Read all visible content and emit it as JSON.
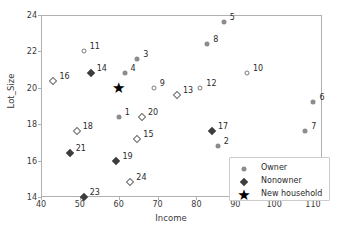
{
  "chart_data": {
    "type": "scatter",
    "title": "",
    "xlabel": "Income",
    "ylabel": "Lot_Size",
    "xlim": [
      40,
      115
    ],
    "ylim": [
      13.4,
      24.3
    ],
    "xticks": [
      40,
      50,
      60,
      70,
      80,
      90,
      100,
      110
    ],
    "yticks": [
      14,
      16,
      18,
      20,
      22,
      24
    ],
    "grid": false,
    "legend_position": "lower right",
    "legend": [
      {
        "label": "Owner",
        "marker": "circle-filled",
        "color": "#8c8c8c"
      },
      {
        "label": "Nonowner",
        "marker": "diamond-filled",
        "color": "#3d3d3d"
      },
      {
        "label": "New household",
        "marker": "star",
        "color": "#000000"
      }
    ],
    "series": [
      {
        "name": "Owner",
        "marker": "circle-filled",
        "color": "#8c8c8c",
        "points": [
          {
            "label": "1",
            "x": 60.0,
            "y": 18.4,
            "label_dx": 6,
            "label_dy": -4
          },
          {
            "label": "2",
            "x": 85.5,
            "y": 16.8,
            "label_dx": 6,
            "label_dy": -4
          },
          {
            "label": "3",
            "x": 64.8,
            "y": 21.6,
            "label_dx": 6,
            "label_dy": -4
          },
          {
            "label": "4",
            "x": 61.5,
            "y": 20.8,
            "label_dx": 6,
            "label_dy": -4
          },
          {
            "label": "5",
            "x": 87.0,
            "y": 23.6,
            "label_dx": 6,
            "label_dy": -4
          },
          {
            "label": "6",
            "x": 110.1,
            "y": 19.2,
            "label_dx": 6,
            "label_dy": -4
          },
          {
            "label": "7",
            "x": 108.0,
            "y": 17.6,
            "label_dx": 6,
            "label_dy": -4
          },
          {
            "label": "8",
            "x": 82.8,
            "y": 22.4,
            "label_dx": 6,
            "label_dy": -4
          }
        ]
      },
      {
        "name": "Owner-open",
        "marker": "circle-open",
        "color": "#7a7a7a",
        "points": [
          {
            "label": "9",
            "x": 69.0,
            "y": 20.0,
            "label_dx": 6,
            "label_dy": -4
          },
          {
            "label": "10",
            "x": 93.0,
            "y": 20.8,
            "label_dx": 6,
            "label_dy": -4
          },
          {
            "label": "11",
            "x": 51.0,
            "y": 22.0,
            "label_dx": 6,
            "label_dy": -4
          },
          {
            "label": "12",
            "x": 81.0,
            "y": 20.0,
            "label_dx": 6,
            "label_dy": -4
          }
        ]
      },
      {
        "name": "Nonowner",
        "marker": "diamond-filled",
        "color": "#3d3d3d",
        "points": [
          {
            "label": "14",
            "x": 52.8,
            "y": 20.8,
            "label_dx": 6,
            "label_dy": -4
          },
          {
            "label": "17",
            "x": 84.0,
            "y": 17.6,
            "label_dx": 6,
            "label_dy": -4
          },
          {
            "label": "19",
            "x": 59.4,
            "y": 16.0,
            "label_dx": 6,
            "label_dy": -4
          },
          {
            "label": "21",
            "x": 47.4,
            "y": 16.4,
            "label_dx": 6,
            "label_dy": -4
          },
          {
            "label": "23",
            "x": 51.0,
            "y": 14.0,
            "label_dx": 6,
            "label_dy": -4
          }
        ]
      },
      {
        "name": "Nonowner-open",
        "marker": "diamond-open",
        "color": "#6a6a6a",
        "points": [
          {
            "label": "13",
            "x": 75.0,
            "y": 19.6,
            "label_dx": 6,
            "label_dy": -4
          },
          {
            "label": "15",
            "x": 64.8,
            "y": 17.2,
            "label_dx": 6,
            "label_dy": -4
          },
          {
            "label": "16",
            "x": 43.2,
            "y": 20.4,
            "label_dx": 6,
            "label_dy": -4
          },
          {
            "label": "18",
            "x": 49.2,
            "y": 17.6,
            "label_dx": 6,
            "label_dy": -4
          },
          {
            "label": "20",
            "x": 66.0,
            "y": 18.4,
            "label_dx": 6,
            "label_dy": -4
          },
          {
            "label": "24",
            "x": 63.0,
            "y": 14.8,
            "label_dx": 6,
            "label_dy": -4
          }
        ]
      },
      {
        "name": "New household",
        "marker": "star",
        "color": "#000000",
        "points": [
          {
            "label": "",
            "x": 60.0,
            "y": 20.0,
            "label_dx": 0,
            "label_dy": 0
          }
        ]
      }
    ]
  }
}
